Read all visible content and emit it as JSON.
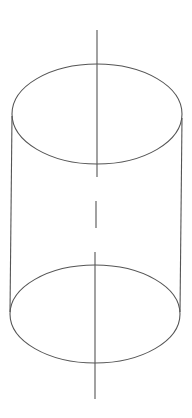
{
  "diagram": {
    "stroke_color": "#555555",
    "background": "#ffffff",
    "top_ellipse": {
      "cx": 97,
      "cy": 114,
      "rx": 85,
      "ry": 50
    },
    "bottom_ellipse": {
      "cx": 95,
      "cy": 314,
      "rx": 85,
      "ry": 49
    },
    "left_side": {
      "x1": 12,
      "y1": 116,
      "x2": 10,
      "y2": 312
    },
    "right_side": {
      "x1": 182,
      "y1": 118,
      "x2": 180,
      "y2": 312
    },
    "axis_segments": [
      {
        "x1": 97,
        "y1": 30,
        "x2": 97,
        "y2": 177
      },
      {
        "x1": 96,
        "y1": 201,
        "x2": 96,
        "y2": 228
      },
      {
        "x1": 95,
        "y1": 252,
        "x2": 95,
        "y2": 399
      }
    ]
  }
}
